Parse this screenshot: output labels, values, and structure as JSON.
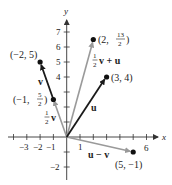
{
  "diagram": {
    "type": "vector-diagram",
    "axes": {
      "x_label": "x",
      "y_label": "y",
      "x_tick_labels": [
        {
          "value": -3,
          "label": "−3"
        },
        {
          "value": -2,
          "label": "−2"
        },
        {
          "value": -1,
          "label": "−1"
        },
        {
          "value": 1,
          "label": "1"
        },
        {
          "value": 6,
          "label": "6"
        }
      ],
      "y_tick_labels": [
        {
          "value": 7,
          "label": "7"
        },
        {
          "value": 6,
          "label": "6"
        },
        {
          "value": 5,
          "label": "5"
        },
        {
          "value": 4,
          "label": "4"
        },
        {
          "value": -2,
          "label": "−2"
        }
      ],
      "x_range": [
        -4.5,
        6.5
      ],
      "y_range": [
        -2.5,
        7.5
      ]
    },
    "points": [
      {
        "id": "p1",
        "x": -2,
        "y": 5,
        "label": "(−2, 5)"
      },
      {
        "id": "p2",
        "x": -1,
        "y": 2.5,
        "label_prefix": "(−1, ",
        "label_num": "5",
        "label_den": "2",
        "label_suffix": ")"
      },
      {
        "id": "p3",
        "x": 2,
        "y": 6.5,
        "label_prefix": "(2, ",
        "label_num": "13",
        "label_den": "2",
        "label_suffix": ")"
      },
      {
        "id": "p4",
        "x": 3,
        "y": 4,
        "label": "(3, 4)"
      },
      {
        "id": "p5",
        "x": 5,
        "y": -1,
        "label": "(5, −1)"
      }
    ],
    "vectors": [
      {
        "name": "v",
        "from": [
          -1,
          2.5
        ],
        "to": [
          -2,
          5
        ],
        "color": "#1a1a1a",
        "label": "v"
      },
      {
        "name": "half_v",
        "from": [
          0,
          0
        ],
        "to": [
          -1,
          2.5
        ],
        "color": "#9a9a9a",
        "label_num": "1",
        "label_den": "2",
        "label_vec": "v"
      },
      {
        "name": "u",
        "from": [
          0,
          0
        ],
        "to": [
          3,
          4
        ],
        "color": "#1a1a1a",
        "label": "u"
      },
      {
        "name": "half_v_plus_u",
        "from": [
          0,
          0
        ],
        "to": [
          2,
          6.5
        ],
        "color": "#9a9a9a",
        "label_num": "1",
        "label_den": "2",
        "label_vec": "v + u"
      },
      {
        "name": "u_minus_v",
        "from": [
          0,
          0
        ],
        "to": [
          5,
          -1
        ],
        "color": "#9a9a9a",
        "label": "u − v"
      }
    ],
    "colors": {
      "black_vector": "#1a1a1a",
      "gray_vector": "#9a9a9a",
      "axis": "#333333"
    }
  }
}
